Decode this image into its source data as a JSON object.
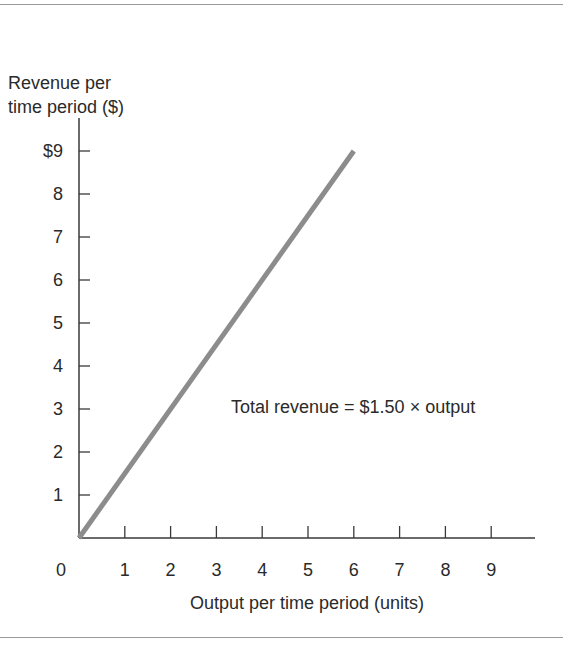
{
  "chart_data": {
    "type": "line",
    "title": "",
    "xlabel": "Output per time period (units)",
    "ylabel": "Revenue per time period ($)",
    "ylabel_lines": [
      "Revenue per",
      "time period ($)"
    ],
    "origin_label": "0",
    "x_ticks": [
      "1",
      "2",
      "3",
      "4",
      "5",
      "6",
      "7",
      "8",
      "9"
    ],
    "y_ticks": [
      "1",
      "2",
      "3",
      "4",
      "5",
      "6",
      "7",
      "8",
      "$9"
    ],
    "xlim": [
      0,
      10
    ],
    "ylim": [
      0,
      10
    ],
    "grid": false,
    "series": [
      {
        "name": "Total revenue",
        "x": [
          0,
          6
        ],
        "y": [
          0,
          9
        ],
        "color": "#8c8c8c"
      }
    ],
    "annotations": [
      {
        "text": "Total revenue = $1.50 × output",
        "x": 5.4,
        "y": 3.2
      }
    ]
  },
  "colors": {
    "axis": "#3a3a3a",
    "line": "#8c8c8c",
    "rule": "#9a9a9a"
  }
}
